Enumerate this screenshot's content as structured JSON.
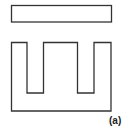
{
  "figure": {
    "label": "(a)",
    "stroke_color": "#333333",
    "background": "#ffffff",
    "parts": [
      {
        "name": "I-bar",
        "shape": "rectangle"
      },
      {
        "name": "E-core",
        "shape": "E-shape with three legs"
      }
    ]
  }
}
